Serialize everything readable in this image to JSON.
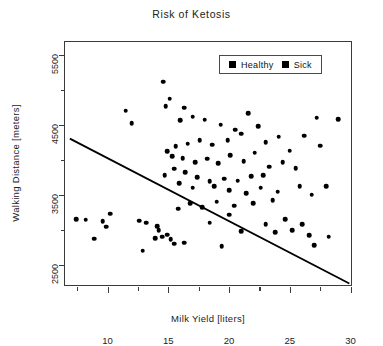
{
  "chart_data": {
    "type": "scatter",
    "title": "Risk of Ketosis",
    "xlabel": "Milk Yield [liters]",
    "ylabel": "Walking Distance [meters]",
    "xlim": [
      6.5,
      30.2
    ],
    "ylim": [
      2180,
      5680
    ],
    "xticks": [
      10,
      15,
      20,
      25,
      30
    ],
    "xtick_labels": [
      "10",
      "15",
      "20",
      "25",
      "30"
    ],
    "xticks_minor": [
      7.5,
      12.5,
      17.5,
      22.5,
      27.5
    ],
    "yticks": [
      2500,
      3500,
      4500,
      5500
    ],
    "ytick_labels": [
      "2500",
      "3500",
      "4500",
      "5500"
    ],
    "yticks_minor": [
      3000,
      4000,
      5000
    ],
    "grid": false,
    "legend_position": "top-right",
    "legend": [
      {
        "name": "Healthy",
        "marker": "square",
        "color": "#000000"
      },
      {
        "name": "Sick",
        "marker": "square",
        "color": "#000000"
      }
    ],
    "marker_color": "#000000",
    "trendline": {
      "type": "line",
      "color": "#000000",
      "x": [
        6.9,
        29.9
      ],
      "y": [
        4300,
        2230
      ]
    },
    "series": [
      {
        "name": "Healthy",
        "marker": "square",
        "color": "#000000",
        "points": [
          [
            14.6,
            5110
          ],
          [
            15.1,
            4870
          ],
          [
            16.0,
            4560
          ],
          [
            18.0,
            4570
          ],
          [
            21.6,
            4660
          ],
          [
            27.2,
            4600
          ],
          [
            29.0,
            4580
          ],
          [
            12.0,
            4520
          ],
          [
            11.5,
            4700
          ],
          [
            14.8,
            4760
          ],
          [
            16.3,
            4740
          ],
          [
            17.0,
            4610
          ],
          [
            19.3,
            4500
          ],
          [
            20.5,
            4430
          ],
          [
            21.0,
            4370
          ],
          [
            22.4,
            4480
          ],
          [
            23.0,
            4250
          ],
          [
            24.1,
            4330
          ],
          [
            25.0,
            4130
          ],
          [
            26.2,
            4340
          ],
          [
            27.5,
            4200
          ],
          [
            19.9,
            4280
          ],
          [
            18.6,
            4210
          ],
          [
            17.6,
            4280
          ],
          [
            16.6,
            4230
          ],
          [
            15.6,
            4190
          ],
          [
            14.9,
            4120
          ],
          [
            15.3,
            4050
          ],
          [
            16.2,
            4020
          ],
          [
            17.2,
            3960
          ],
          [
            18.2,
            4010
          ],
          [
            19.1,
            3950
          ],
          [
            20.1,
            4060
          ],
          [
            21.2,
            3980
          ],
          [
            22.1,
            4100
          ],
          [
            23.3,
            3900
          ],
          [
            24.4,
            3960
          ],
          [
            25.5,
            3880
          ],
          [
            22.8,
            3780
          ],
          [
            21.8,
            3760
          ],
          [
            20.7,
            3700
          ],
          [
            19.6,
            3730
          ],
          [
            18.4,
            3690
          ],
          [
            17.4,
            3750
          ],
          [
            16.4,
            3820
          ],
          [
            15.5,
            3870
          ],
          [
            14.7,
            3780
          ],
          [
            15.9,
            3660
          ],
          [
            17.0,
            3600
          ],
          [
            18.8,
            3620
          ],
          [
            20.0,
            3560
          ],
          [
            21.4,
            3520
          ],
          [
            22.6,
            3600
          ],
          [
            24.0,
            3540
          ],
          [
            25.8,
            3620
          ],
          [
            26.8,
            3500
          ],
          [
            28.0,
            3620
          ],
          [
            23.6,
            3420
          ],
          [
            22.0,
            3380
          ],
          [
            20.4,
            3340
          ],
          [
            19.0,
            3400
          ],
          [
            17.8,
            3320
          ],
          [
            16.8,
            3380
          ],
          [
            15.8,
            3300
          ]
        ]
      },
      {
        "name": "Sick",
        "marker": "square",
        "color": "#000000",
        "points": [
          [
            7.4,
            3150
          ],
          [
            8.2,
            3140
          ],
          [
            9.6,
            3120
          ],
          [
            9.9,
            3040
          ],
          [
            10.2,
            3230
          ],
          [
            8.9,
            2870
          ],
          [
            12.6,
            3130
          ],
          [
            13.2,
            3100
          ],
          [
            14.2,
            2990
          ],
          [
            14.5,
            2900
          ],
          [
            14.9,
            2930
          ],
          [
            15.2,
            2860
          ],
          [
            15.5,
            2800
          ],
          [
            16.3,
            2810
          ],
          [
            13.9,
            2880
          ],
          [
            14.1,
            3050
          ],
          [
            18.4,
            3100
          ],
          [
            19.4,
            2760
          ],
          [
            24.6,
            3150
          ],
          [
            25.2,
            2990
          ],
          [
            26.0,
            3080
          ],
          [
            26.6,
            2920
          ],
          [
            23.0,
            3080
          ],
          [
            23.8,
            2960
          ],
          [
            27.0,
            2780
          ],
          [
            28.2,
            2900
          ],
          [
            21.0,
            2980
          ],
          [
            20.0,
            3210
          ],
          [
            12.9,
            2700
          ]
        ]
      }
    ]
  }
}
